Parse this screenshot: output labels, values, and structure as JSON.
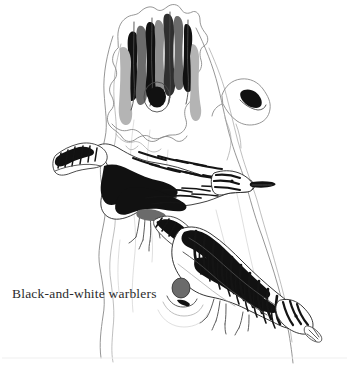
{
  "plate": {
    "title": "Black-and-white warblers",
    "medium": "pen-and-ink wash illustration",
    "background_color": "#ffffff",
    "ink_color": "#111111",
    "caption_color": "#2b2b2b",
    "width": 349,
    "height": 365
  },
  "caption": {
    "text": "Black-and-white warblers"
  },
  "subjects": [
    {
      "name": "upper-warbler",
      "label": "Black-and-white warbler",
      "pose": "clinging to trunk, head up and facing right",
      "plumage": "bold black and white longitudinal stripes"
    },
    {
      "name": "lower-warbler",
      "label": "Black-and-white warbler",
      "pose": "creeping head-downward along the trunk, facing lower right",
      "plumage": "bold black and white longitudinal stripes"
    }
  ],
  "scenery": {
    "name": "broken tree trunk",
    "features": [
      "splintered broken top with dark ink wash",
      "knot hole near upper right of stump",
      "round knot low on the trunk with concentric rings",
      "vertical bark grain lines"
    ]
  }
}
